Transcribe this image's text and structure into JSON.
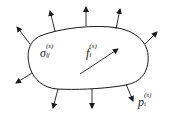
{
  "diagram": {
    "type": "body-with-surface-tractions",
    "colors": {
      "stroke": "#1a1a1a",
      "background": "#ffffff"
    },
    "labels": {
      "stress": {
        "symbol": "σ",
        "sub": "ij",
        "sup": "(s)"
      },
      "body_force": {
        "symbol": "f",
        "sub": "i",
        "sup": "(s)"
      },
      "traction": {
        "symbol": "p",
        "sub": "i",
        "sup": "(s)"
      }
    },
    "arrows": {
      "surface_count": 9,
      "internal_count": 1
    }
  }
}
